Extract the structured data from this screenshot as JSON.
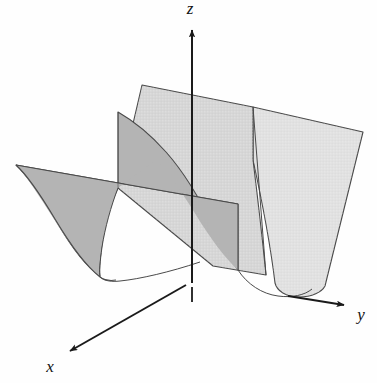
{
  "figure": {
    "kind": "3d-surface-plot",
    "background_color": "#fefefe",
    "surface": {
      "equation": "z = y^2",
      "name": "parabolic-cylinder",
      "front_panel_color": "#b4b4b4",
      "back_panel_color": "#d6d6d6",
      "right_panel_color": "#e1e1e1",
      "outline_color": "#4a4a4a",
      "outline_width": 1.1
    },
    "axes": {
      "color": "#1a1a1a",
      "width": 2.0,
      "items": [
        {
          "id": "z",
          "label": "z",
          "direction": "up",
          "label_x": 190,
          "label_y": 14
        },
        {
          "id": "y",
          "label": "y",
          "direction": "right-down",
          "label_x": 361,
          "label_y": 320
        },
        {
          "id": "x",
          "label": "x",
          "direction": "left-down",
          "label_x": 50,
          "label_y": 372
        }
      ]
    },
    "origin": {
      "x": 192,
      "y": 283
    }
  }
}
